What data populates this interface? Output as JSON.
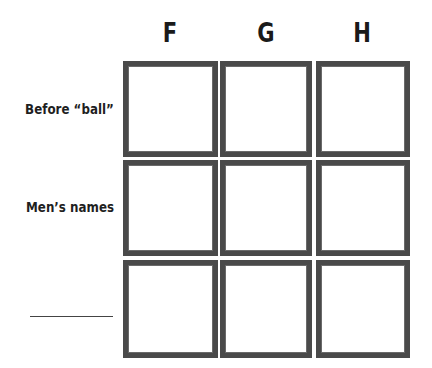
{
  "grid": {
    "columns": [
      {
        "label": "F"
      },
      {
        "label": "G"
      },
      {
        "label": "H"
      }
    ],
    "rows": [
      {
        "label": "Before “ball”"
      },
      {
        "label": "Men’s names"
      },
      {
        "label": "",
        "blank_line": true
      }
    ],
    "cells": [
      [
        "",
        "",
        ""
      ],
      [
        "",
        "",
        ""
      ],
      [
        "",
        "",
        ""
      ]
    ]
  },
  "colors": {
    "border": "#4a4a4a",
    "text": "#1a1a1a",
    "background": "#ffffff"
  }
}
